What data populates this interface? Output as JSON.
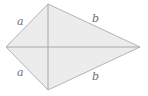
{
  "diagram": {
    "type": "kite",
    "fill_color": "#ececec",
    "stroke_color": "#b4b4b4",
    "diagonal_color": "#a8a8a8",
    "label_color": "#707070",
    "vertices": {
      "left": [
        6,
        47
      ],
      "top": [
        48,
        4
      ],
      "right": [
        140,
        47
      ],
      "bottom": [
        48,
        90
      ]
    },
    "labels": {
      "upper_left": "a",
      "lower_left": "a",
      "upper_right": "b",
      "lower_right": "b"
    }
  }
}
